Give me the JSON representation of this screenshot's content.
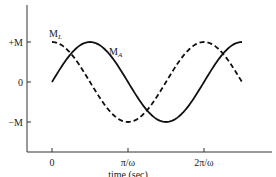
{
  "chart_data": {
    "type": "line",
    "title": "",
    "xlabel": "time (sec)",
    "ylabel": "",
    "x_ticks": [
      "0",
      "π/ω",
      "2π/ω"
    ],
    "y_ticks": [
      "+M",
      "0",
      "−M"
    ],
    "xlim_in_pi_over_omega": [
      0,
      2.5
    ],
    "ylim": [
      -1,
      1
    ],
    "grid": false,
    "legend": "inline labels",
    "series": [
      {
        "name": "M_A",
        "style": "solid",
        "function": "M·sin(ωt)",
        "x_pi_over_omega": [
          0,
          0.5,
          1,
          1.5,
          2,
          2.5
        ],
        "values": [
          0,
          1,
          0,
          -1,
          0,
          1
        ]
      },
      {
        "name": "M_L",
        "style": "dashed",
        "function": "M·cos(ωt)",
        "x_pi_over_omega": [
          0,
          0.5,
          1,
          1.5,
          2,
          2.5
        ],
        "values": [
          1,
          0,
          -1,
          0,
          1,
          0
        ]
      }
    ]
  },
  "labels": {
    "y_plus": "+M",
    "y_zero": "0",
    "y_minus": "−M",
    "x_zero": "0",
    "x_pi": "π/ω",
    "x_2pi": "2π/ω",
    "x_axis_title": "time (sec)",
    "series_a_main": "M",
    "series_a_sub": "A",
    "series_l_main": "M",
    "series_l_sub": "L"
  }
}
